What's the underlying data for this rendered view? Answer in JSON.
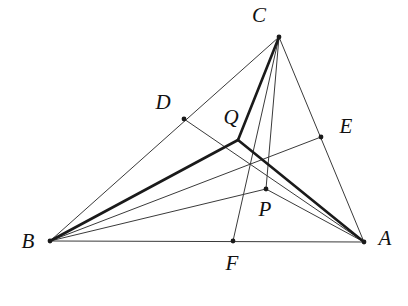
{
  "figure": {
    "background_color": "#ffffff",
    "stroke_color": "#1a1a1a",
    "thin_stroke_color": "#3a3a3a",
    "thin_width": 1,
    "thick_width": 2.6,
    "dot_radius": 2.4,
    "canvas": {
      "width": 408,
      "height": 306
    }
  },
  "points": [
    {
      "id": "A",
      "label": "A",
      "x": 364,
      "y": 242,
      "label_x": 385,
      "label_y": 240,
      "dot": true,
      "kind": "vertex"
    },
    {
      "id": "B",
      "label": "B",
      "x": 50,
      "y": 241,
      "label_x": 28,
      "label_y": 243,
      "dot": true,
      "kind": "vertex"
    },
    {
      "id": "C",
      "label": "C",
      "x": 279,
      "y": 37,
      "label_x": 259,
      "label_y": 17,
      "dot": true,
      "kind": "vertex"
    },
    {
      "id": "D",
      "label": "D",
      "x": 184,
      "y": 119,
      "label_x": 163,
      "label_y": 104,
      "dot": true,
      "kind": "point-on-side"
    },
    {
      "id": "E",
      "label": "E",
      "x": 321,
      "y": 137,
      "label_x": 346,
      "label_y": 128,
      "dot": true,
      "kind": "point-on-side"
    },
    {
      "id": "F",
      "label": "F",
      "x": 233,
      "y": 241,
      "label_x": 232,
      "label_y": 265,
      "dot": true,
      "kind": "point-on-side"
    },
    {
      "id": "P",
      "label": "P",
      "x": 266,
      "y": 189,
      "label_x": 265,
      "label_y": 211,
      "dot": true,
      "kind": "interior-point"
    },
    {
      "id": "Q",
      "label": "Q",
      "x": 238,
      "y": 140,
      "label_x": 231,
      "label_y": 119,
      "dot": false,
      "kind": "interior-point"
    }
  ],
  "segments": [
    {
      "id": "seg-BA",
      "from": "B",
      "to": "A",
      "weight": "thin",
      "name": "side-BA"
    },
    {
      "id": "seg-BC",
      "from": "B",
      "to": "C",
      "weight": "thin",
      "name": "side-BC"
    },
    {
      "id": "seg-CA",
      "from": "C",
      "to": "A",
      "weight": "thin",
      "name": "side-CA"
    },
    {
      "id": "seg-CF",
      "from": "C",
      "to": "F",
      "weight": "thin",
      "name": "cevian-CF"
    },
    {
      "id": "seg-BE",
      "from": "B",
      "to": "E",
      "weight": "thin",
      "name": "cevian-BE"
    },
    {
      "id": "seg-AD",
      "from": "A",
      "to": "D",
      "weight": "thin",
      "name": "cevian-AD"
    },
    {
      "id": "seg-BP",
      "from": "B",
      "to": "P",
      "weight": "thin",
      "name": "segment-BP"
    },
    {
      "id": "seg-AP",
      "from": "A",
      "to": "P",
      "weight": "thin",
      "name": "segment-AP"
    },
    {
      "id": "seg-CP",
      "from": "C",
      "to": "P",
      "weight": "thin",
      "name": "segment-CP"
    },
    {
      "id": "seg-QC",
      "from": "Q",
      "to": "C",
      "weight": "thick",
      "name": "steiner-QC"
    },
    {
      "id": "seg-QB",
      "from": "Q",
      "to": "B",
      "weight": "thick",
      "name": "steiner-QB"
    },
    {
      "id": "seg-QA",
      "from": "Q",
      "to": "A",
      "weight": "thick",
      "name": "steiner-QA"
    }
  ]
}
